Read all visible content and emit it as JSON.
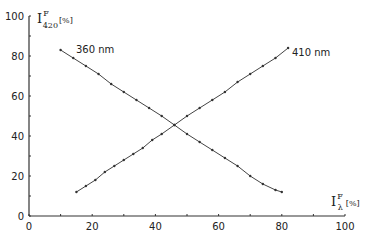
{
  "chart_data": {
    "type": "line",
    "title": "",
    "xlabel": "I^F_λ [%]",
    "ylabel": "I^F_420 [%]",
    "xlim": [
      0,
      100
    ],
    "ylim": [
      0,
      100
    ],
    "x_ticks": [
      0,
      20,
      40,
      60,
      80,
      100
    ],
    "y_ticks": [
      0,
      20,
      40,
      60,
      80,
      100
    ],
    "grid": false,
    "legend": "inline labels",
    "series": [
      {
        "name": "360 nm",
        "x": [
          10,
          14,
          18,
          22,
          26,
          30,
          34,
          38,
          42,
          46,
          50,
          54,
          58,
          62,
          66,
          70,
          74,
          78,
          80
        ],
        "y": [
          83,
          79,
          75,
          71,
          66,
          62,
          58,
          54,
          50,
          45.5,
          41,
          37,
          33,
          29,
          25,
          20,
          16,
          13,
          12
        ]
      },
      {
        "name": "410 nm",
        "x": [
          15,
          18,
          21,
          24,
          27,
          30,
          33,
          36,
          39,
          42,
          46,
          50,
          54,
          58,
          62,
          66,
          70,
          74,
          78,
          82
        ],
        "y": [
          12,
          15,
          18,
          22,
          25,
          28,
          31,
          34,
          38,
          41,
          45.5,
          50,
          54,
          58,
          62,
          67,
          71,
          75,
          79,
          84
        ]
      }
    ]
  },
  "labels": {
    "y_axis_main": "I",
    "y_axis_sup": "F",
    "y_axis_sub": "420",
    "y_axis_unit": "[%]",
    "x_axis_main": "I",
    "x_axis_sup": "F",
    "x_axis_sub": "λ",
    "x_axis_unit": "[%]",
    "series_360": "360 nm",
    "series_410": "410 nm"
  }
}
